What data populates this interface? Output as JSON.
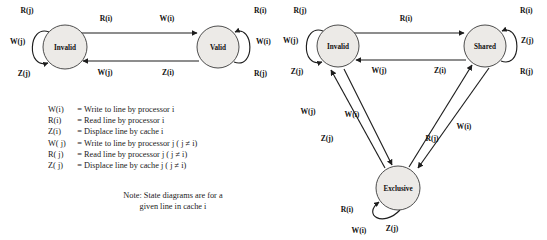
{
  "figure": {
    "title_present": false,
    "colors": {
      "node_fill": "#eceae7",
      "node_stroke": "#3a3a3a",
      "edge": "#1d1d1d",
      "text": "#111111",
      "background": "#ffffff"
    }
  },
  "left_diagram": {
    "name": "write-through-state-diagram",
    "states": [
      {
        "id": "invalid",
        "label": "Invalid",
        "cx": 65,
        "cy": 47,
        "r": 22
      },
      {
        "id": "valid",
        "label": "Valid",
        "cx": 218,
        "cy": 47,
        "r": 21
      }
    ],
    "self_loops": [
      {
        "id": "invalid-self-loop",
        "state": "invalid",
        "side": "left",
        "labels": [
          {
            "text": "R(j)",
            "fn": "R",
            "arg": "j",
            "x": 27,
            "y": 13
          },
          {
            "text": "W(j)",
            "fn": "W",
            "arg": "j",
            "x": 10,
            "y": 44
          },
          {
            "text": "Z(j)",
            "fn": "Z",
            "arg": "j",
            "x": 24,
            "y": 76
          }
        ]
      },
      {
        "id": "valid-self-loop",
        "state": "valid",
        "side": "right",
        "labels": [
          {
            "text": "R(i)",
            "fn": "R",
            "arg": "i",
            "x": 254,
            "y": 13
          },
          {
            "text": "W(i)",
            "fn": "W",
            "arg": "i",
            "x": 256,
            "y": 44
          },
          {
            "text": "R(j)",
            "fn": "R",
            "arg": "j",
            "x": 254,
            "y": 76
          }
        ]
      }
    ],
    "transitions": [
      {
        "id": "invalid-to-valid",
        "from": "Invalid",
        "to": "Valid",
        "labels": [
          {
            "text": "R(i)",
            "fn": "R",
            "arg": "i",
            "x": 106,
            "y": 21
          },
          {
            "text": "W(i)",
            "fn": "W",
            "arg": "i",
            "x": 167,
            "y": 21
          }
        ]
      },
      {
        "id": "valid-to-invalid",
        "from": "Valid",
        "to": "Invalid",
        "labels": [
          {
            "text": "W(j)",
            "fn": "W",
            "arg": "j",
            "x": 105,
            "y": 75
          },
          {
            "text": "Z(i)",
            "fn": "Z",
            "arg": "i",
            "x": 168,
            "y": 75
          }
        ]
      }
    ]
  },
  "right_diagram": {
    "name": "write-back-state-diagram",
    "states": [
      {
        "id": "invalid",
        "label": "Invalid",
        "cx": 338,
        "cy": 46,
        "r": 21
      },
      {
        "id": "shared",
        "label": "Shared",
        "cx": 485,
        "cy": 46,
        "r": 21
      },
      {
        "id": "exclusive",
        "label": "Exclusive",
        "cx": 398,
        "cy": 188,
        "r": 22
      }
    ],
    "self_loops": [
      {
        "id": "invalid-self-loop",
        "state": "invalid",
        "side": "left",
        "labels": [
          {
            "text": "R(j)",
            "fn": "R",
            "arg": "j",
            "x": 300,
            "y": 13
          },
          {
            "text": "W(j)",
            "fn": "W",
            "arg": "j",
            "x": 283,
            "y": 43
          },
          {
            "text": "Z(j)",
            "fn": "Z",
            "arg": "j",
            "x": 297,
            "y": 74
          }
        ]
      },
      {
        "id": "shared-self-loop",
        "state": "shared",
        "side": "right",
        "labels": [
          {
            "text": "R(i)",
            "fn": "R",
            "arg": "i",
            "x": 520,
            "y": 13
          },
          {
            "text": "Z(j)",
            "fn": "Z",
            "arg": "j",
            "x": 521,
            "y": 43
          },
          {
            "text": "R(j)",
            "fn": "R",
            "arg": "j",
            "x": 520,
            "y": 74
          }
        ]
      },
      {
        "id": "exclusive-self-loop",
        "state": "exclusive",
        "side": "bottom-left",
        "labels": [
          {
            "text": "R(i)",
            "fn": "R",
            "arg": "i",
            "x": 347,
            "y": 212
          },
          {
            "text": "W(i)",
            "fn": "W",
            "arg": "i",
            "x": 359,
            "y": 233
          },
          {
            "text": "Z(j)",
            "fn": "Z",
            "arg": "j",
            "x": 392,
            "y": 231
          }
        ]
      }
    ],
    "transitions": [
      {
        "id": "invalid-to-shared",
        "from": "Invalid",
        "to": "Shared",
        "labels": [
          {
            "text": "R(i)",
            "fn": "R",
            "arg": "i",
            "x": 406,
            "y": 21
          }
        ]
      },
      {
        "id": "shared-to-invalid",
        "from": "Shared",
        "to": "Invalid",
        "labels": [
          {
            "text": "W(j)",
            "fn": "W",
            "arg": "j",
            "x": 379,
            "y": 73
          },
          {
            "text": "Z(i)",
            "fn": "Z",
            "arg": "i",
            "x": 440,
            "y": 73
          }
        ]
      },
      {
        "id": "exclusive-to-invalid",
        "from": "Exclusive",
        "to": "Invalid",
        "labels": [
          {
            "text": "W(j)",
            "fn": "W",
            "arg": "j",
            "x": 308,
            "y": 114
          },
          {
            "text": "Z(j)",
            "fn": "Z",
            "arg": "j",
            "x": 327,
            "y": 141
          }
        ]
      },
      {
        "id": "invalid-to-exclusive",
        "from": "Invalid",
        "to": "Exclusive",
        "labels": [
          {
            "text": "W(i)",
            "fn": "W",
            "arg": "i",
            "x": 352,
            "y": 117
          }
        ]
      },
      {
        "id": "exclusive-to-shared",
        "from": "Exclusive",
        "to": "Shared",
        "labels": [
          {
            "text": "R(j)",
            "fn": "R",
            "arg": "j",
            "x": 432,
            "y": 141
          }
        ]
      },
      {
        "id": "shared-to-exclusive",
        "from": "Shared",
        "to": "Exclusive",
        "labels": [
          {
            "text": "W(i)",
            "fn": "W",
            "arg": "i",
            "x": 464,
            "y": 129
          }
        ]
      }
    ]
  },
  "legend": {
    "name": "notation-legend",
    "rows": [
      {
        "term": "W(i)",
        "eq": "=",
        "desc": "Write to line by processor i",
        "desc_plain": "Write to line by processor",
        "italic_tail": "i"
      },
      {
        "term": "R(i)",
        "eq": "=",
        "desc": "Read line by processor i",
        "desc_plain": "Read line by processor",
        "italic_tail": "i"
      },
      {
        "term": "Z(i)",
        "eq": "=",
        "desc": "Displace line by cache i",
        "desc_plain": "Displace line by cache",
        "italic_tail": "i"
      },
      {
        "term": "W( j)",
        "eq": "=",
        "desc": "Write to line by processor j ( j ≠ i)",
        "desc_plain": "Write to line by processor",
        "italic_tail": "j ( j ≠ i)"
      },
      {
        "term": "R( j)",
        "eq": "=",
        "desc": "Read line by processor j ( j ≠ i)",
        "desc_plain": "Read line by processor",
        "italic_tail": "j ( j ≠ i)"
      },
      {
        "term": "Z( j)",
        "eq": "=",
        "desc": "Displace line by cache j ( j ≠ i)",
        "desc_plain": "Displace line by cache",
        "italic_tail": "j ( j ≠ i)"
      }
    ]
  },
  "note": {
    "name": "figure-note",
    "line1": "Note: State diagrams are for a",
    "line2": "given line in cache i"
  }
}
